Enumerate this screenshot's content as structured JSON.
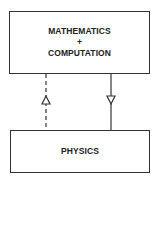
{
  "diagram": {
    "nodes": [
      {
        "id": "math",
        "lines": [
          "MATHEMATICS",
          "+",
          "COMPUTATION"
        ]
      },
      {
        "id": "physics",
        "lines": [
          "PHYSICS"
        ]
      }
    ],
    "edges": [
      {
        "from": "physics",
        "to": "math",
        "style": "dashed",
        "arrow": "up-open-triangle"
      },
      {
        "from": "math",
        "to": "physics",
        "style": "solid",
        "arrow": "down-open-triangle"
      }
    ]
  }
}
